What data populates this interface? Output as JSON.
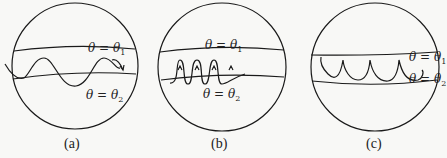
{
  "figure": {
    "panels": [
      {
        "id": "a",
        "caption": "(a)",
        "label_top": "θ = θ",
        "sub_top": "1",
        "label_bottom": "θ = θ",
        "sub_bottom": "2",
        "motion": "sinusoidal nutation between latitude bands"
      },
      {
        "id": "b",
        "caption": "(b)",
        "label_top": "θ = θ",
        "sub_top": "1",
        "label_bottom": "θ = θ",
        "sub_bottom": "2",
        "motion": "looping nutation"
      },
      {
        "id": "c",
        "caption": "(c)",
        "label_top": "θ = θ",
        "sub_top": "1",
        "label_bottom": "θ = θ",
        "sub_bottom": "2",
        "motion": "cusped nutation"
      }
    ],
    "colors": {
      "stroke": "#1a1a1a",
      "background": "#f8f8f6"
    }
  }
}
